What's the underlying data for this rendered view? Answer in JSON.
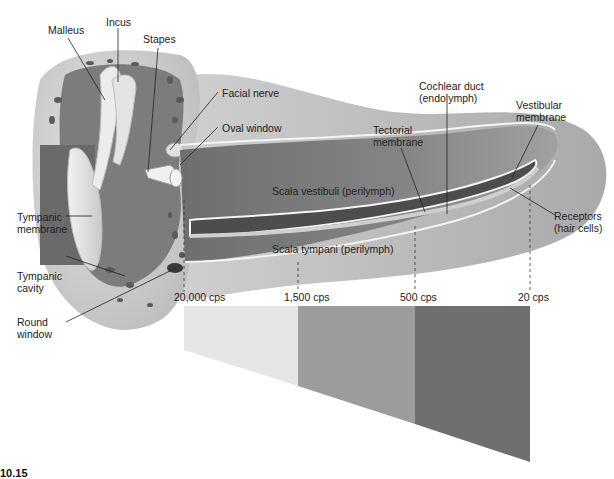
{
  "figure": {
    "type": "anatomical-diagram",
    "labels": {
      "malleus": "Malleus",
      "incus": "Incus",
      "stapes": "Stapes",
      "facial_nerve": "Facial nerve",
      "oval_window": "Oval window",
      "tympanic_membrane_1": "Tympanic",
      "tympanic_membrane_2": "membrane",
      "tympanic_cavity_1": "Tympanic",
      "tympanic_cavity_2": "cavity",
      "round_window_1": "Round",
      "round_window_2": "window",
      "cochlear_duct_1": "Cochlear duct",
      "cochlear_duct_2": "(endolymph)",
      "tectorial_membrane_1": "Tectorial",
      "tectorial_membrane_2": "membrane",
      "vestibular_membrane_1": "Vestibular",
      "vestibular_membrane_2": "membrane",
      "scala_vestibuli": "Scala vestibuli (perilymph)",
      "scala_tympani": "Scala tympani (perilymph)",
      "receptors_1": "Receptors",
      "receptors_2": "(hair cells)"
    },
    "frequency_markers": [
      {
        "label": "20,000 cps",
        "x": 184
      },
      {
        "label": "1,500 cps",
        "x": 298
      },
      {
        "label": "500 cps",
        "x": 415
      },
      {
        "label": "20 cps",
        "x": 530
      }
    ],
    "frequency_bands": [
      {
        "name": "high",
        "color": "#e6e6e6"
      },
      {
        "name": "mid",
        "color": "#9c9c9c"
      },
      {
        "name": "low",
        "color": "#6f6f6f"
      }
    ],
    "colors": {
      "bone": "#d9d9d9",
      "cavity_dark": "#6a6a6a",
      "cochlea_fill": "#8a8a8a",
      "membrane_white": "#f4f4f4"
    },
    "caption_fragment": "10.15"
  }
}
